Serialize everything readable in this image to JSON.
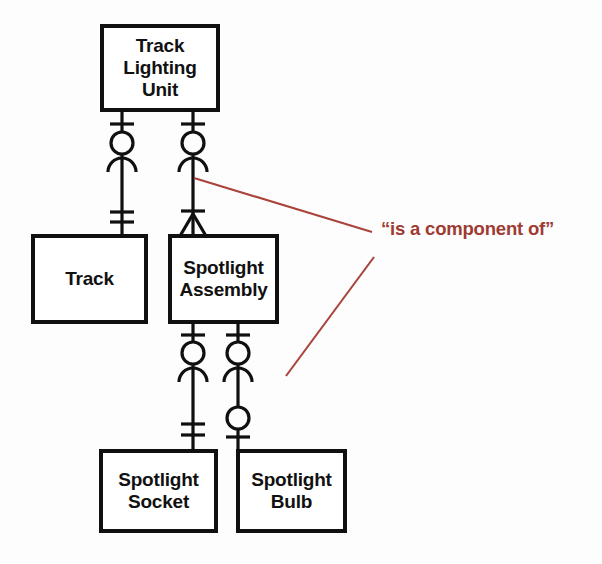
{
  "diagram": {
    "type": "entity-relationship-diagram",
    "notation": "crows-foot",
    "background_color": "#fdfdfd",
    "line_color": "#101010",
    "annotation_color": "#9e3b33",
    "entities": [
      {
        "id": "track-lighting-unit",
        "label": "Track\nLighting\nUnit",
        "x": 102,
        "y": 26,
        "width": 116,
        "height": 84
      },
      {
        "id": "track",
        "label": "Track",
        "x": 33,
        "y": 236,
        "width": 113,
        "height": 86
      },
      {
        "id": "spotlight-assembly",
        "label": "Spotlight\nAssembly",
        "x": 170,
        "y": 236,
        "width": 107,
        "height": 86
      },
      {
        "id": "spotlight-socket",
        "label": "Spotlight\nSocket",
        "x": 101,
        "y": 451,
        "width": 115,
        "height": 80
      },
      {
        "id": "spotlight-bulb",
        "label": "Spotlight\nBulb",
        "x": 238,
        "y": 451,
        "width": 107,
        "height": 80
      }
    ],
    "relationships": [
      {
        "id": "unit-to-track",
        "from": "track-lighting-unit",
        "to": "track",
        "x": 122,
        "top_y": 110,
        "bottom_y": 236,
        "parent_end": "one-mandatory-tick",
        "child_end": "optional-many",
        "child_tick": "double-tick"
      },
      {
        "id": "unit-to-spotlight-assembly",
        "from": "track-lighting-unit",
        "to": "spotlight-assembly",
        "x": 193,
        "top_y": 110,
        "bottom_y": 236,
        "parent_end": "one-mandatory-tick",
        "child_end": "optional-many",
        "child_tick": "single-tick-crowsfoot"
      },
      {
        "id": "assembly-to-socket",
        "from": "spotlight-assembly",
        "to": "spotlight-socket",
        "x": 193,
        "top_y": 322,
        "bottom_y": 451,
        "parent_end": "one-mandatory-tick",
        "child_end": "optional-many",
        "child_tick": "double-tick"
      },
      {
        "id": "assembly-to-bulb",
        "from": "spotlight-assembly",
        "to": "spotlight-bulb",
        "x": 238,
        "top_y": 322,
        "bottom_y": 451,
        "parent_end": "one-mandatory-tick",
        "child_end": "optional-many",
        "child_tick": "circle-tick"
      }
    ],
    "annotation": {
      "text": "“is a component of”",
      "x": 381,
      "y": 218,
      "color": "#9e3b33",
      "leader_lines": [
        {
          "id": "upper-leader",
          "x1": 194,
          "y1": 178,
          "x2": 372,
          "y2": 232
        },
        {
          "id": "lower-leader",
          "x1": 286,
          "y1": 376,
          "x2": 374,
          "y2": 257
        }
      ]
    }
  }
}
